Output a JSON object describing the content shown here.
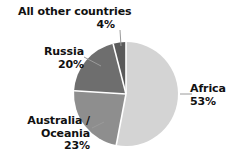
{
  "chart_data": {
    "type": "pie",
    "title": "",
    "subtitle": "",
    "xlabel": "",
    "ylabel": "",
    "grid": false,
    "legend_position": "none",
    "label_format": "name + percent",
    "units": "percent",
    "categories": [
      "Africa",
      "Australia / Oceania",
      "Russia",
      "All other countries"
    ],
    "values": [
      53,
      23,
      20,
      4
    ],
    "slices": [
      {
        "name": "Africa",
        "label_line1": "Africa",
        "label_line2": "53%",
        "value": 53,
        "value_text": "53%",
        "color": "#d4d4d4",
        "start_angle_deg": 0,
        "end_angle_deg": 190.8
      },
      {
        "name": "Australia / Oceania",
        "label_line1": "Australia /",
        "label_line2": "Oceania",
        "label_line3": "23%",
        "value": 23,
        "value_text": "23%",
        "color": "#8e8e8e",
        "start_angle_deg": 190.8,
        "end_angle_deg": 273.6
      },
      {
        "name": "Russia",
        "label_line1": "Russia",
        "label_line2": "20%",
        "value": 20,
        "value_text": "20%",
        "color": "#6e6e6e",
        "start_angle_deg": 273.6,
        "end_angle_deg": 345.6
      },
      {
        "name": "All other countries",
        "label_line1": "All other countries",
        "label_line2": "4%",
        "value": 4,
        "value_text": "4%",
        "color": "#5a5a5a",
        "start_angle_deg": 345.6,
        "end_angle_deg": 360
      }
    ],
    "total": 100,
    "separator_color": "#ffffff",
    "background_color": "#ffffff",
    "text_color": "#111111",
    "leader_line_color": "#9a9a9a"
  }
}
